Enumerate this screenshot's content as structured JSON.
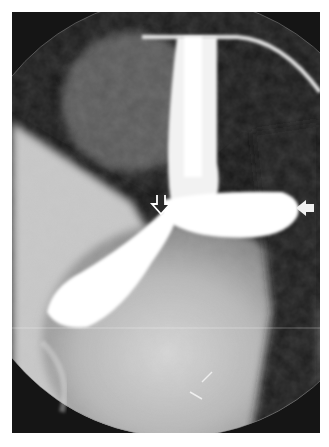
{
  "image": {
    "type": "radiograph",
    "description": "Fluoroscopic barium contrast study showing esophagus with contrast filling a pouch and stomach",
    "background_color": "#ffffff",
    "frame_color": "#141414"
  },
  "annotations": [
    {
      "name": "open-arrow",
      "style": "outlined, pointing down",
      "x": 161,
      "y": 200
    },
    {
      "name": "solid-arrow",
      "style": "filled white, pointing left",
      "x": 305,
      "y": 208
    }
  ]
}
